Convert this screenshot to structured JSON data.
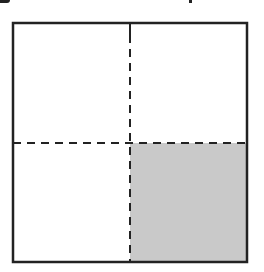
{
  "diagram": {
    "type": "grid-square",
    "rows": 2,
    "cols": 2,
    "shaded_cells": [
      {
        "row": 1,
        "col": 1
      }
    ],
    "colors": {
      "border": "#222222",
      "divider": "#222222",
      "shade": "#c9c9c9",
      "background": "#ffffff"
    }
  }
}
